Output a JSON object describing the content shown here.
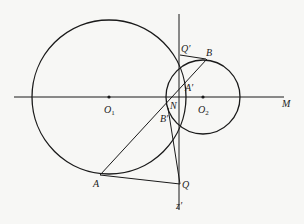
{
  "diagram": {
    "labels": {
      "O1": "O",
      "O1_sub": "1",
      "O2": "O",
      "O2_sub": "2",
      "M": "M",
      "N": "N",
      "A": "A",
      "B": "B",
      "A_prime": "A′",
      "B_prime": "B′",
      "Q": "Q",
      "Q_prime": "Q′",
      "z_prime": "z′"
    },
    "stroke_color": "#1a1a1a",
    "background_color": "#f7f7f5"
  }
}
